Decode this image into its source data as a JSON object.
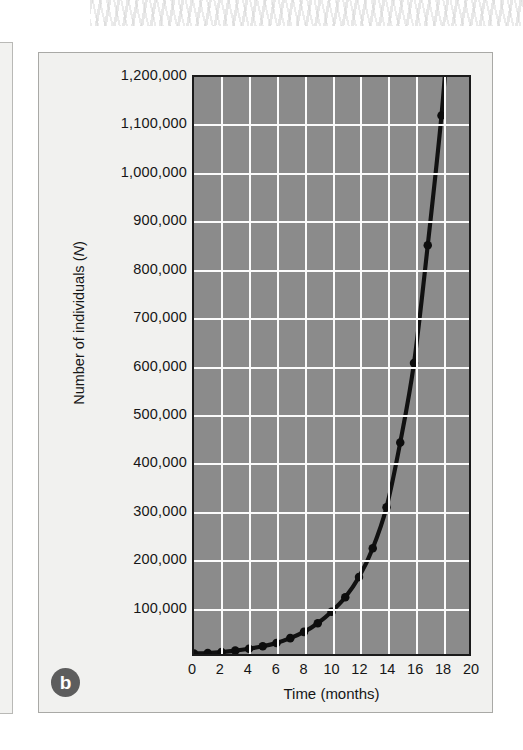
{
  "figure": {
    "panel_label": "b",
    "neighbor_panel_label": "a"
  },
  "colors": {
    "plot_background": "#8b8b8b",
    "gridline": "#fbfbfb",
    "axis_frame": "#1b1b1b",
    "curve": "#111111",
    "marker": "#0d0d0d",
    "panel_background": "#f1f1ef",
    "panel_border": "#a9a9a6",
    "badge_background": "#5d5d5d",
    "badge_text": "#ffffff",
    "text": "#161616"
  },
  "chart_data": {
    "type": "line",
    "title": "",
    "subtitle": "",
    "xlabel": "Time (months)",
    "ylabel_prefix": "Number of individuals (",
    "ylabel_italic": "N",
    "ylabel_suffix": ")",
    "ylabel_full": "Number of individuals (N)",
    "xlim": [
      0,
      20
    ],
    "ylim": [
      0,
      1200000
    ],
    "xticks": [
      0,
      2,
      4,
      6,
      8,
      10,
      12,
      14,
      16,
      18,
      20
    ],
    "xtick_labels": [
      "0",
      "2",
      "4",
      "6",
      "8",
      "10",
      "12",
      "14",
      "16",
      "18",
      "20"
    ],
    "yticks": [
      100000,
      200000,
      300000,
      400000,
      500000,
      600000,
      700000,
      800000,
      900000,
      1000000,
      1100000,
      1200000
    ],
    "ytick_labels": [
      "100,000",
      "200,000",
      "300,000",
      "400,000",
      "500,000",
      "600,000",
      "700,000",
      "800,000",
      "900,000",
      "1,000,000",
      "1,100,000",
      "1,200,000"
    ],
    "grid": true,
    "legend": false,
    "legend_position": "none",
    "series": [
      {
        "name": "Exponential population growth",
        "marker": "filled-circle",
        "x": [
          0,
          1,
          2,
          3,
          4,
          5,
          6,
          7,
          8,
          9,
          10,
          11,
          12,
          13,
          14,
          15,
          16,
          17,
          18
        ],
        "y": [
          1000,
          2000,
          4000,
          7000,
          11000,
          16000,
          23000,
          33000,
          46000,
          64000,
          88000,
          118000,
          160000,
          220000,
          305000,
          440000,
          605000,
          850000,
          1120000
        ]
      }
    ],
    "annotations": [
      {
        "text": "b",
        "kind": "panel-label",
        "position": "bottom-left"
      }
    ]
  }
}
